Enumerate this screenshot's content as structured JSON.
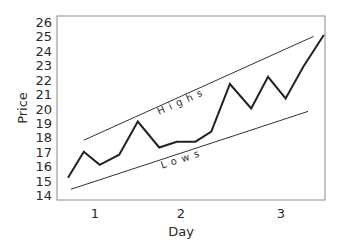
{
  "chart_data": {
    "type": "line",
    "title": "",
    "xlabel": "Day",
    "ylabel": "Price",
    "xlim": [
      0.65,
      3.48
    ],
    "ylim": [
      14,
      26
    ],
    "xticks": [
      1,
      2,
      3
    ],
    "yticks": [
      14,
      15,
      16,
      17,
      18,
      19,
      20,
      21,
      22,
      23,
      24,
      25,
      26
    ],
    "grid": false,
    "legend": null,
    "series": [
      {
        "name": "Price",
        "color": "#222222",
        "x": [
          0.71,
          0.88,
          1.05,
          1.26,
          1.46,
          1.69,
          1.88,
          2.08,
          2.25,
          2.45,
          2.68,
          2.86,
          3.05,
          3.24,
          3.46
        ],
        "y": [
          15.2,
          17.0,
          16.1,
          16.8,
          19.1,
          17.3,
          17.7,
          17.7,
          18.4,
          21.7,
          20.0,
          22.2,
          20.7,
          22.9,
          25.1
        ]
      },
      {
        "name": "Highs",
        "color": "#333333",
        "x": [
          0.88,
          3.35
        ],
        "y": [
          17.8,
          25.0
        ]
      },
      {
        "name": "Lows",
        "color": "#333333",
        "x": [
          0.74,
          3.29
        ],
        "y": [
          14.4,
          19.8
        ]
      }
    ],
    "annotations": [
      {
        "text": "Highs",
        "x": 1.95,
        "y": 20.3,
        "angle": -24
      },
      {
        "text": "Lows",
        "x": 1.95,
        "y": 16.3,
        "angle": -18
      }
    ]
  }
}
